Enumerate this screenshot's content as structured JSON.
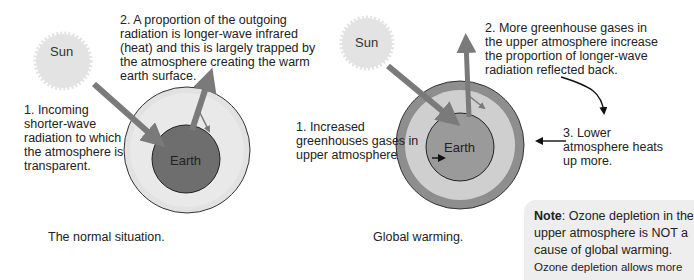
{
  "colors": {
    "sun_fill": "#e3e3e3",
    "arrow": "#7a7a7a",
    "normal_earth": "#6e6e6e",
    "normal_atmosphere": "#e2e2e2",
    "warming_earth": "#9a9a9a",
    "warming_lower_atmosphere": "#cfcfcf",
    "warming_upper_atmosphere": "#8e8e8e",
    "note_bg": "#eeeeee"
  },
  "left_panel": {
    "sun_label": "Sun",
    "earth_label": "Earth",
    "label1_lines": [
      "1. Incoming",
      "shorter-wave",
      "radiation to which",
      "the atmosphere is",
      "transparent."
    ],
    "label2_lines": [
      "2. A proportion of the outgoing",
      "radiation is longer-wave infrared",
      "(heat) and this is largely trapped by",
      "the atmosphere creating the warm",
      "earth surface."
    ],
    "caption": "The normal situation."
  },
  "right_panel": {
    "sun_label": "Sun",
    "earth_label": "Earth",
    "label1_lines": [
      "1. Increased",
      "greenhouses gases in",
      "upper atmosphere"
    ],
    "label2_lines": [
      "2. More greenhouse gases in",
      "the upper atmosphere increase",
      "the proportion of longer-wave",
      "radiation reflected back."
    ],
    "label3_lines": [
      "3. Lower",
      "atmosphere heats",
      "up more."
    ],
    "caption": "Global warming."
  },
  "note": {
    "strong": "Note",
    "line1_rest": ": Ozone depletion in the",
    "line2": "upper atmosphere is NOT a",
    "line3": "cause of global warming.",
    "line4": "Ozone depletion allows more"
  }
}
